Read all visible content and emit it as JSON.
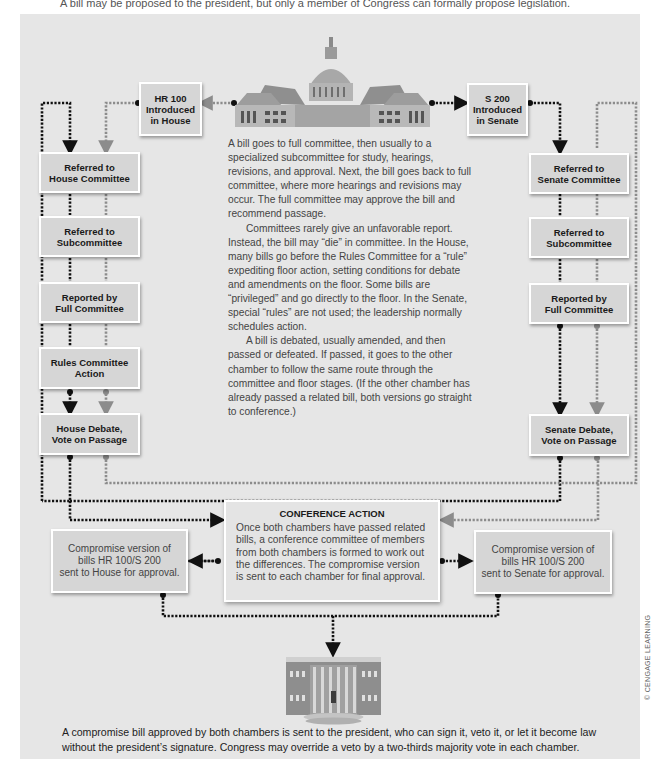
{
  "top_strip_text": "A bill may be proposed to the president, but only a member of Congress can formally propose legislation.",
  "colors": {
    "background": "#e6e6e6",
    "box_fill": "#d6d6d6",
    "box_border": "#ffffff",
    "house_path": "#111111",
    "senate_path": "#8c8c8c"
  },
  "icons": {
    "capitol": "capitol-building-icon",
    "white_house": "white-house-icon"
  },
  "house": {
    "introduced": [
      "HR 100",
      "Introduced",
      "in House"
    ],
    "steps": [
      [
        "Referred to",
        "House Committee"
      ],
      [
        "Referred to",
        "Subcommittee"
      ],
      [
        "Reported by",
        "Full Committee"
      ],
      [
        "Rules Committee",
        "Action"
      ],
      [
        "House Debate,",
        "Vote on Passage"
      ]
    ]
  },
  "senate": {
    "introduced": [
      "S 200",
      "Introduced",
      "in Senate"
    ],
    "steps": [
      [
        "Referred to",
        "Senate Committee"
      ],
      [
        "Referred to",
        "Subcommittee"
      ],
      [
        "Reported by",
        "Full Committee"
      ],
      [
        "Senate Debate,",
        "Vote on Passage"
      ]
    ]
  },
  "explanation": [
    "A bill goes to full committee, then usually to a specialized subcommittee for study, hearings, revisions, and approval. Next, the bill goes back to full committee, where more hearings and revisions may occur. The full committee may approve the bill and recommend passage.",
    "Committees rarely give an unfavorable report. Instead, the bill may “die” in committee. In the House, many bills go before the Rules Committee for a “rule” expediting floor action, setting conditions for debate and amendments on the floor. Some bills are “privileged” and go directly to the floor. In the Senate, special “rules” are not used; the leadership normally schedules action.",
    "A bill is debated, usually amended, and then passed or defeated. If passed, it goes to the other chamber to follow the same route through the committee and floor stages. (If the other chamber has already passed a related bill, both versions go straight to conference.)"
  ],
  "conference": {
    "title": "CONFERENCE ACTION",
    "text": "Once both chambers have passed related bills, a conference committee of members from both chambers is formed to work out the differences. The compromise version is sent to each chamber for final approval."
  },
  "compromise_house": [
    "Compromise version of",
    "bills HR 100/S 200",
    "sent to House for approval."
  ],
  "compromise_senate": [
    "Compromise version of",
    "bills HR 100/S 200",
    "sent to Senate for approval."
  ],
  "president_text": "A compromise bill approved by both chambers is sent to the president, who can sign it, veto it, or let it become law without the president’s signature. Congress may override a veto by a two-thirds majority vote in each chamber.",
  "credit": "© CENGAGE LEARNING"
}
